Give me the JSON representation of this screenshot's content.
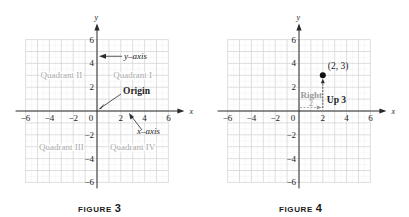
{
  "chart_data": [
    {
      "type": "scatter",
      "title": "FIGURE 3",
      "caption_word": "FIGURE",
      "caption_number": "3",
      "xlabel": "x",
      "ylabel": "y",
      "xlim": [
        -6,
        6
      ],
      "ylim": [
        -6,
        6
      ],
      "grid": true,
      "x_ticks": [
        -6,
        -4,
        -2,
        0,
        2,
        4,
        6
      ],
      "x_tick_labels": [
        "−6",
        "−4",
        "−2",
        "0",
        "2",
        "4",
        "6"
      ],
      "y_ticks": [
        6,
        4,
        2,
        -2,
        -4,
        -6
      ],
      "y_tick_labels": [
        "6",
        "4",
        "2",
        "−2",
        "−4",
        "−6"
      ],
      "quadrant_labels": [
        {
          "text": "Quadrant II",
          "x": -3,
          "y": 3
        },
        {
          "text": "Quadrant I",
          "x": 3,
          "y": 3
        },
        {
          "text": "Quadrant III",
          "x": -3,
          "y": -3
        },
        {
          "text": "Quadrant IV",
          "x": 3,
          "y": -3
        }
      ],
      "annotations": [
        {
          "text": "y–axis",
          "points_to": "y-axis",
          "at": [
            0,
            4.5
          ]
        },
        {
          "text": "Origin",
          "points_to": "origin",
          "at": [
            0,
            0
          ]
        },
        {
          "text": "x–axis",
          "points_to": "x-axis",
          "at": [
            2.5,
            0
          ]
        }
      ],
      "points": []
    },
    {
      "type": "scatter",
      "title": "FIGURE 4",
      "caption_word": "FIGURE",
      "caption_number": "4",
      "xlabel": "x",
      "ylabel": "y",
      "xlim": [
        -6,
        6
      ],
      "ylim": [
        -6,
        6
      ],
      "grid": true,
      "x_ticks": [
        -6,
        -4,
        -2,
        0,
        2,
        4,
        6
      ],
      "x_tick_labels": [
        "−6",
        "−4",
        "−2",
        "0",
        "2",
        "4",
        "6"
      ],
      "y_ticks": [
        6,
        4,
        2,
        -2,
        -4,
        -6
      ],
      "y_tick_labels": [
        "6",
        "4",
        "2",
        "−2",
        "−4",
        "−6"
      ],
      "points": [
        {
          "x": 2,
          "y": 3,
          "label": "(2, 3)"
        }
      ],
      "annotations": [
        {
          "text": "Right",
          "describes": "horizontal move from origin",
          "value_label": "2"
        },
        {
          "text": "Up 3",
          "describes": "vertical move to point"
        }
      ]
    }
  ],
  "colors": {
    "axis": "#2a2a2a",
    "grid": "#d6d6d6",
    "grid_minor": "#e9e9e9",
    "quadrant_text": "#a8a8a8",
    "label_text": "#1e1e1e",
    "guide_text": "#9a9a9a"
  }
}
